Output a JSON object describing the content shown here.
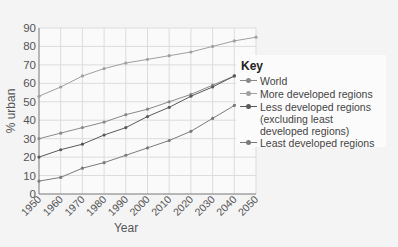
{
  "chart_data": {
    "type": "line",
    "title": "",
    "xlabel": "Year",
    "ylabel": "% urban",
    "x": [
      1950,
      1960,
      1970,
      1980,
      1990,
      2000,
      2010,
      2020,
      2030,
      2040,
      2050
    ],
    "x_tick_labels": [
      "1950",
      "1960",
      "1970",
      "1980",
      "1990",
      "2000",
      "2010",
      "2020",
      "2030",
      "2040",
      "2050"
    ],
    "y_ticks": [
      0,
      10,
      20,
      30,
      40,
      50,
      60,
      70,
      80,
      90
    ],
    "ylim": [
      0,
      90
    ],
    "xlim": [
      1950,
      2050
    ],
    "grid": true,
    "legend_position": "right",
    "legend_title": "Key",
    "series": [
      {
        "name": "World",
        "color": "#8a8a8a",
        "values": [
          30,
          33,
          36,
          39,
          43,
          46,
          50,
          54,
          59,
          64,
          69
        ]
      },
      {
        "name": "More developed regions",
        "color": "#a0a0a0",
        "values": [
          53,
          58,
          64,
          68,
          71,
          73,
          75,
          77,
          80,
          83,
          85
        ]
      },
      {
        "name": "Less developed regions (excluding least developed regions)",
        "color": "#5a5a5a",
        "values": [
          20,
          24,
          27,
          32,
          36,
          42,
          47,
          53,
          58,
          64,
          70
        ]
      },
      {
        "name": "Least developed regions",
        "color": "#7a7a7a",
        "values": [
          7,
          9,
          14,
          17,
          21,
          25,
          29,
          34,
          41,
          48,
          55
        ]
      }
    ]
  },
  "legend": {
    "title": "Key",
    "items": [
      {
        "label": "World"
      },
      {
        "label": "More developed regions"
      },
      {
        "label": "Less developed regions"
      },
      {
        "label": "(excluding least"
      },
      {
        "label": "developed regions)"
      },
      {
        "label": "Least developed regions"
      }
    ]
  },
  "axes": {
    "xlabel": "Year",
    "ylabel": "% urban"
  }
}
